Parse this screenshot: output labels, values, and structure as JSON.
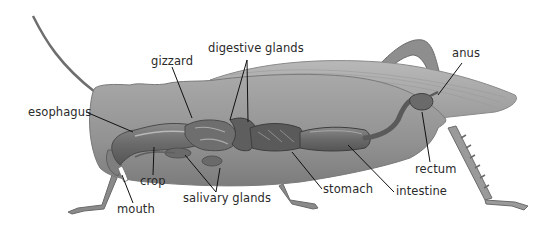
{
  "diagram": {
    "labels": {
      "digestive_glands": "digestive glands",
      "gizzard": "gizzard",
      "anus": "anus",
      "esophagus": "esophagus",
      "crop": "crop",
      "mouth": "mouth",
      "salivary_glands": "salivary glands",
      "stomach": "stomach",
      "intestine": "intestine",
      "rectum": "rectum"
    },
    "colors": {
      "body": "#9a9a9a",
      "body_dark": "#7a7a7a",
      "gut": "#6e6e6e",
      "wing": "#a8a8a8",
      "leg": "#8a8a8a",
      "leader_line": "#111111",
      "text": "#2a2a2a"
    }
  }
}
